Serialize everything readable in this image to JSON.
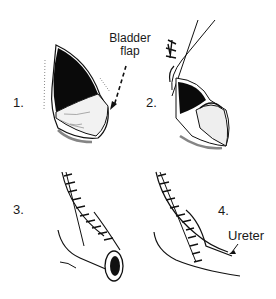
{
  "figure": {
    "panels": [
      {
        "number": "1.",
        "description": "Bladder flap raised"
      },
      {
        "number": "2.",
        "description": "Flap sutured to ureter"
      },
      {
        "number": "3.",
        "description": "Flap tubularized"
      },
      {
        "number": "4.",
        "description": "Completed anastomosis with ureter"
      }
    ],
    "annotations": {
      "bladder_flap_line1": "Bladder",
      "bladder_flap_line2": "flap",
      "ureter": "Ureter"
    }
  }
}
